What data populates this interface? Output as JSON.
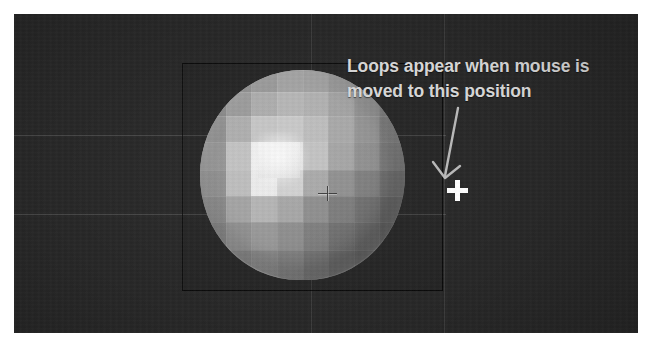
{
  "app": {
    "kind": "3d-modeling-viewport-screenshot",
    "background_color": "#ffffff",
    "viewport_color": "#262626"
  },
  "viewport": {
    "name": "3d-viewport",
    "object": {
      "name": "sphere",
      "shading": "faceted-low-poly",
      "highlight_color": "#f4f4f4",
      "base_color": "#9a9a9a",
      "shadow_color": "#5e5e5e"
    },
    "bounding_box": {
      "label": "selection-bounding-box",
      "border_color": "#000000"
    },
    "grid": {
      "visible": true,
      "line_color": "#c8c8c8"
    },
    "pivot": {
      "label": "3d-cursor",
      "x": 313,
      "y": 179
    },
    "mouse_cursor": {
      "label": "crosshair-cursor",
      "glyph": "+",
      "color": "#ffffff",
      "x": 443,
      "y": 176
    }
  },
  "annotation": {
    "text": "Loops appear when mouse is moved to this position",
    "line1": "Loops appear when mouse is",
    "line2": "moved to this position",
    "color": "#d9d9d9",
    "arrow": {
      "name": "annotation-arrow",
      "color": "#b4b4b4",
      "direction": "down-left"
    }
  },
  "facets": {
    "rows": [
      {
        "top": 0,
        "height": 22,
        "colors": [
          "#7e7e7e",
          "#8d8d8d",
          "#9a9a9a",
          "#a4a4a4",
          "#a2a2a2",
          "#989898",
          "#8a8a8a",
          "#7c7c7c"
        ]
      },
      {
        "top": 22,
        "height": 24,
        "colors": [
          "#868686",
          "#9b9b9b",
          "#adadad",
          "#b6b6b6",
          "#b1b1b1",
          "#a3a3a3",
          "#919191",
          "#7f7f7f"
        ]
      },
      {
        "top": 46,
        "height": 26,
        "colors": [
          "#8f8f8f",
          "#aeaeae",
          "#c6c6c6",
          "#c9c9c9",
          "#bdbdbd",
          "#a8a8a8",
          "#949494",
          "#7e7e7e"
        ]
      },
      {
        "top": 72,
        "height": 28,
        "colors": [
          "#949494",
          "#c2c2c2",
          "#efefef",
          "#e2e2e2",
          "#c2c2c2",
          "#a5a5a5",
          "#8f8f8f",
          "#7a7a7a"
        ]
      },
      {
        "top": 100,
        "height": 26,
        "colors": [
          "#8e8e8e",
          "#bdbdbd",
          "#ececec",
          "#d2d2d2",
          "#a9a9a9",
          "#8f8f8f",
          "#7e7e7e",
          "#6e6e6e"
        ]
      },
      {
        "top": 126,
        "height": 26,
        "colors": [
          "#878787",
          "#a3a3a3",
          "#b4b4b4",
          "#a6a6a6",
          "#8d8d8d",
          "#7b7b7b",
          "#6f6f6f",
          "#656565"
        ]
      },
      {
        "top": 152,
        "height": 28,
        "colors": [
          "#7f7f7f",
          "#909090",
          "#989898",
          "#8d8d8d",
          "#7d7d7d",
          "#6f6f6f",
          "#686868",
          "#606060"
        ]
      },
      {
        "top": 180,
        "height": 30,
        "colors": [
          "#767676",
          "#828282",
          "#888888",
          "#808080",
          "#747474",
          "#6a6a6a",
          "#636363",
          "#5c5c5c"
        ]
      }
    ]
  },
  "grid_lines": {
    "horizontal": [
      {
        "name": "grid-line-upper",
        "top": 121,
        "left": 0,
        "width": 432
      },
      {
        "name": "grid-line-lower",
        "top": 200,
        "left": 0,
        "width": 432
      }
    ],
    "vertical": [
      {
        "name": "grid-line-center",
        "left": 297,
        "top": 0,
        "height": 319
      },
      {
        "name": "grid-line-right",
        "left": 430,
        "top": 0,
        "height": 319
      }
    ]
  }
}
